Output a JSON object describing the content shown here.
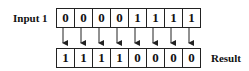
{
  "input_label": "Input 1",
  "result_label": "Result",
  "input_bits": [
    "0",
    "0",
    "0",
    "0",
    "1",
    "1",
    "1",
    "1"
  ],
  "result_bits": [
    "1",
    "1",
    "1",
    "1",
    "0",
    "0",
    "0",
    "0"
  ],
  "colors": {
    "line": "#222222",
    "background": "#ffffff"
  }
}
